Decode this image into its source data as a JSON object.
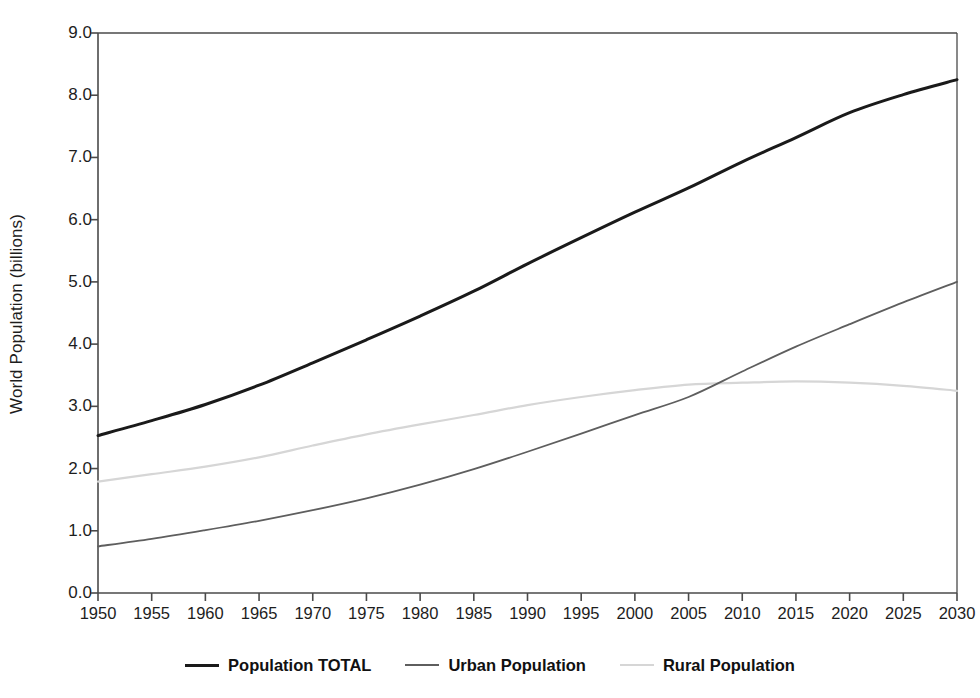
{
  "chart_data": {
    "type": "line",
    "title": "",
    "xlabel": "",
    "ylabel": "World Population (billions)",
    "xlim": [
      1950,
      2030
    ],
    "ylim": [
      0.0,
      9.0
    ],
    "grid": false,
    "legend_position": "bottom-center",
    "x": [
      1950,
      1955,
      1960,
      1965,
      1970,
      1975,
      1980,
      1985,
      1990,
      1995,
      2000,
      2005,
      2010,
      2015,
      2020,
      2025,
      2030
    ],
    "xtick_labels": [
      "1950",
      "1955",
      "1960",
      "1965",
      "1970",
      "1975",
      "1980",
      "1985",
      "1990",
      "1995",
      "2000",
      "2005",
      "2010",
      "2015",
      "2020",
      "2025",
      "2030"
    ],
    "ytick_values": [
      0.0,
      1.0,
      2.0,
      3.0,
      4.0,
      5.0,
      6.0,
      7.0,
      8.0,
      9.0
    ],
    "ytick_labels": [
      "0.0",
      "1.0",
      "2.0",
      "3.0",
      "4.0",
      "5.0",
      "6.0",
      "7.0",
      "8.0",
      "9.0"
    ],
    "series": [
      {
        "name": "Population TOTAL",
        "color": "#1a1a1a",
        "width": 3.0,
        "values": [
          2.53,
          2.77,
          3.03,
          3.34,
          3.7,
          4.07,
          4.45,
          4.85,
          5.29,
          5.71,
          6.12,
          6.51,
          6.93,
          7.32,
          7.72,
          8.01,
          8.25
        ]
      },
      {
        "name": "Urban Population",
        "color": "#5e5e5e",
        "width": 1.8,
        "values": [
          0.75,
          0.87,
          1.01,
          1.16,
          1.33,
          1.52,
          1.74,
          1.99,
          2.27,
          2.56,
          2.86,
          3.15,
          3.56,
          3.96,
          4.32,
          4.67,
          5.0
        ]
      },
      {
        "name": "Rural Population",
        "color": "#d6d6d6",
        "width": 2.2,
        "values": [
          1.79,
          1.91,
          2.03,
          2.18,
          2.37,
          2.55,
          2.71,
          2.86,
          3.02,
          3.15,
          3.26,
          3.35,
          3.38,
          3.4,
          3.38,
          3.33,
          3.25
        ]
      }
    ]
  },
  "axes": {
    "y_title": "World Population (billions)",
    "axis_color": "#4a4a4a"
  },
  "legend": {
    "items": [
      {
        "label": "Population TOTAL",
        "color": "#1a1a1a",
        "thickness": "3px"
      },
      {
        "label": "Urban Population",
        "color": "#5e5e5e",
        "thickness": "2px"
      },
      {
        "label": "Rural Population",
        "color": "#d6d6d6",
        "thickness": "2px"
      }
    ]
  }
}
